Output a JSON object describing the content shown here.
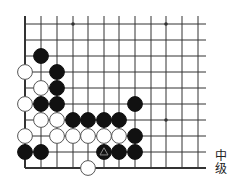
{
  "problem": {
    "level_label_line1": "中",
    "level_label_line2": "级",
    "level": "中级"
  },
  "board": {
    "columns_x": [
      25,
      41,
      57,
      73,
      88,
      104,
      119,
      135,
      151,
      166,
      182,
      198
    ],
    "rows_y": [
      24,
      40,
      56,
      72,
      88,
      104,
      120,
      136,
      152,
      168
    ],
    "right_edge_x": 206,
    "top_extent_y": 16,
    "star_points": [
      [
        3,
        0
      ],
      [
        9,
        0
      ],
      [
        9,
        6
      ]
    ],
    "stones": [
      {
        "color": "black",
        "col": 1,
        "row": 2
      },
      {
        "color": "white",
        "col": 0,
        "row": 3
      },
      {
        "color": "black",
        "col": 2,
        "row": 3
      },
      {
        "color": "white",
        "col": 1,
        "row": 4
      },
      {
        "color": "black",
        "col": 2,
        "row": 4
      },
      {
        "color": "white",
        "col": 0,
        "row": 5
      },
      {
        "color": "black",
        "col": 1,
        "row": 5
      },
      {
        "color": "black",
        "col": 2,
        "row": 5
      },
      {
        "color": "black",
        "col": 7,
        "row": 5
      },
      {
        "color": "white",
        "col": 1,
        "row": 6
      },
      {
        "color": "white",
        "col": 2,
        "row": 6
      },
      {
        "color": "black",
        "col": 3,
        "row": 6
      },
      {
        "color": "black",
        "col": 4,
        "row": 6
      },
      {
        "color": "black",
        "col": 5,
        "row": 6
      },
      {
        "color": "black",
        "col": 6,
        "row": 6
      },
      {
        "color": "white",
        "col": 0,
        "row": 7
      },
      {
        "color": "white",
        "col": 2,
        "row": 7
      },
      {
        "color": "white",
        "col": 3,
        "row": 7
      },
      {
        "color": "white",
        "col": 4,
        "row": 7
      },
      {
        "color": "white",
        "col": 5,
        "row": 7
      },
      {
        "color": "white",
        "col": 6,
        "row": 7
      },
      {
        "color": "black",
        "col": 7,
        "row": 7
      },
      {
        "color": "black",
        "col": 0,
        "row": 8
      },
      {
        "color": "black",
        "col": 1,
        "row": 8
      },
      {
        "color": "black",
        "col": 5,
        "row": 8,
        "mark": "triangle"
      },
      {
        "color": "black",
        "col": 6,
        "row": 8
      },
      {
        "color": "black",
        "col": 7,
        "row": 8
      },
      {
        "color": "white",
        "col": 4,
        "row": 9
      }
    ],
    "colors": {
      "line": "#333333",
      "black": "#111111",
      "white": "#ffffff",
      "mark": "#888888"
    }
  }
}
